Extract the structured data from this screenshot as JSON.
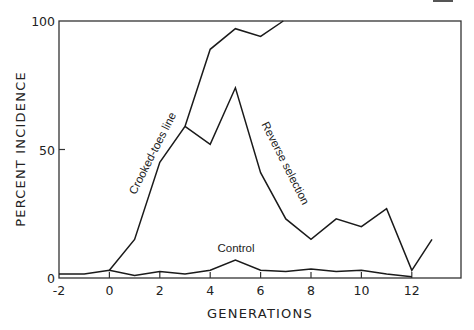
{
  "chart_data": {
    "type": "line",
    "title": "",
    "xlabel": "GENERATIONS",
    "ylabel": "PERCENT INCIDENCE",
    "xlim": [
      -2,
      14
    ],
    "ylim": [
      0,
      100
    ],
    "x_ticks": [
      -2,
      0,
      2,
      4,
      6,
      8,
      10,
      12
    ],
    "x_tick_labels": [
      "-2",
      "0",
      "2",
      "4",
      "6",
      "8",
      "10",
      "12"
    ],
    "y_ticks": [
      0,
      50,
      100
    ],
    "y_tick_labels": [
      "0",
      "50",
      "100"
    ],
    "grid": false,
    "legend": "inline labels",
    "series": [
      {
        "name": "Crooked-toes line",
        "x": [
          0,
          1,
          2,
          3,
          4,
          5,
          6,
          6.9
        ],
        "values": [
          3,
          15,
          45,
          59,
          89,
          97,
          94,
          100
        ]
      },
      {
        "name": "Reverse selection",
        "x": [
          3,
          4,
          5,
          6,
          7,
          8,
          9,
          10,
          11,
          12,
          12.8
        ],
        "values": [
          59,
          52,
          74,
          41,
          23,
          15,
          23,
          20,
          27,
          3,
          15
        ]
      },
      {
        "name": "Control",
        "x": [
          -2,
          -1,
          0,
          1,
          2,
          3,
          4,
          5,
          6,
          7,
          8,
          9,
          10,
          11,
          12
        ],
        "values": [
          1.5,
          1.5,
          3,
          1,
          2.5,
          1.5,
          3,
          7,
          3,
          2.5,
          3.5,
          2.5,
          3,
          1.5,
          0.5
        ]
      }
    ]
  }
}
